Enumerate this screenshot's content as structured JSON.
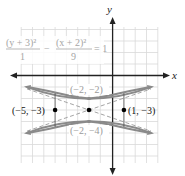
{
  "figure": {
    "equation": {
      "term1_num": "(y + 3)²",
      "term1_den": "1",
      "minus": "−",
      "term2_num": "(x + 2)²",
      "term2_den": "9",
      "rhs": "= 1"
    },
    "axes": {
      "x_label": "x",
      "y_label": "y"
    },
    "center": {
      "label": "",
      "x": -2,
      "y": -3
    },
    "vertices": [
      {
        "label": "(−2, −2)",
        "x": -2,
        "y": -2
      },
      {
        "label": "(−2, −4)",
        "x": -2,
        "y": -4
      }
    ],
    "points": [
      {
        "label": "(−5, −3)",
        "x": -5,
        "y": -3
      },
      {
        "label": "(1, −3)",
        "x": 1,
        "y": -3
      }
    ],
    "colors": {
      "curve": "#8a8a8a",
      "axis": "#222222",
      "grid": "#d9d9d9"
    }
  }
}
